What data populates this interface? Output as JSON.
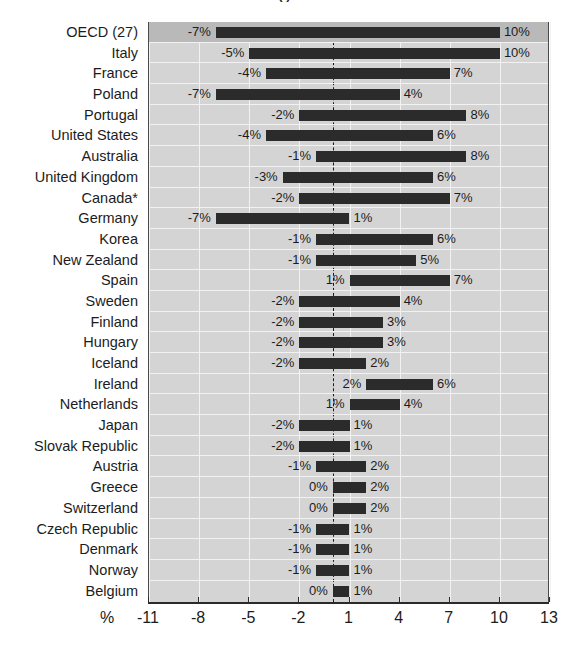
{
  "title": {
    "text": "(   )",
    "visible_fragment": true
  },
  "axis": {
    "unit_symbol": "%",
    "tick_labels": [
      "-11",
      "-8",
      "-5",
      "-2",
      "1",
      "4",
      "7",
      "10",
      "13"
    ],
    "tick_values": [
      -11,
      -8,
      -5,
      -2,
      1,
      4,
      7,
      10,
      13
    ]
  },
  "colors": {
    "bar": "#2b2b2b",
    "plot_background": "#d4d4d4",
    "highlight_row": "#b9b9b9",
    "gridline": "#f2f2f2",
    "zero_line": "#1a1a1a",
    "text": "#1c1c1c"
  },
  "chart_data": {
    "type": "bar",
    "orientation": "horizontal",
    "title": "(   )",
    "xlabel": "%",
    "ylabel": "",
    "xlim": [
      -11,
      13
    ],
    "grid": true,
    "legend": null,
    "categories": [
      "OECD (27)",
      "Italy",
      "France",
      "Poland",
      "Portugal",
      "United States",
      "Australia",
      "United Kingdom",
      "Canada*",
      "Germany",
      "Korea",
      "New Zealand",
      "Spain",
      "Sweden",
      "Finland",
      "Hungary",
      "Iceland",
      "Ireland",
      "Netherlands",
      "Japan",
      "Slovak Republic",
      "Austria",
      "Greece",
      "Switzerland",
      "Czech Republic",
      "Denmark",
      "Norway",
      "Belgium"
    ],
    "series": [
      {
        "name": "Lower bound",
        "values": [
          -7,
          -5,
          -4,
          -7,
          -2,
          -4,
          -1,
          -3,
          -2,
          -7,
          -1,
          -1,
          1,
          -2,
          -2,
          -2,
          -2,
          2,
          1,
          -2,
          -2,
          -1,
          0,
          0,
          -1,
          -1,
          -1,
          0
        ],
        "labels": [
          "-7%",
          "-5%",
          "-4%",
          "-7%",
          "-2%",
          "-4%",
          "-1%",
          "-3%",
          "-2%",
          "-7%",
          "-1%",
          "-1%",
          "1%",
          "-2%",
          "-2%",
          "-2%",
          "-2%",
          "2%",
          "1%",
          "-2%",
          "-2%",
          "-1%",
          "0%",
          "0%",
          "-1%",
          "-1%",
          "-1%",
          "0%"
        ]
      },
      {
        "name": "Upper bound",
        "values": [
          10,
          10,
          7,
          4,
          8,
          6,
          8,
          6,
          7,
          1,
          6,
          5,
          7,
          4,
          3,
          3,
          2,
          6,
          4,
          1,
          1,
          2,
          2,
          2,
          1,
          1,
          1,
          1
        ],
        "labels": [
          "10%",
          "10%",
          "7%",
          "4%",
          "8%",
          "6%",
          "8%",
          "6%",
          "7%",
          "1%",
          "6%",
          "5%",
          "7%",
          "4%",
          "3%",
          "3%",
          "2%",
          "6%",
          "4%",
          "1%",
          "1%",
          "2%",
          "2%",
          "2%",
          "1%",
          "1%",
          "1%",
          "1%"
        ]
      }
    ],
    "highlighted_category": "OECD (27)",
    "footnote_marker": "*"
  }
}
